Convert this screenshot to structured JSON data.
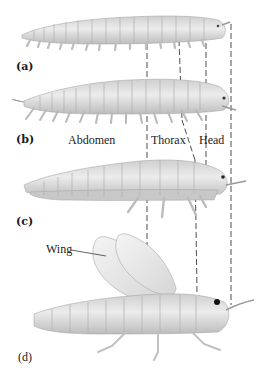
{
  "figure": {
    "panels": [
      {
        "id": "a",
        "label": "(a)",
        "description": "Segmented worm-like ancestor with paired legs on every segment"
      },
      {
        "id": "b",
        "label": "(b)",
        "description": "Segmented animal with slightly differentiated head"
      },
      {
        "id": "c",
        "label": "(c)",
        "description": "Segments grouped; legs reduced on abdomen"
      },
      {
        "id": "d",
        "label": "(d)",
        "description": "Winged insect with distinct head, thorax and abdomen"
      }
    ],
    "region_labels": {
      "abdomen": "Abdomen",
      "thorax": "Thorax",
      "head": "Head"
    },
    "callouts": {
      "wing": "Wing"
    },
    "colors": {
      "body_fill": "#dedede",
      "body_shade": "#b9b9b9",
      "segment_line": "#9a9a9a",
      "dashed_line": "#333333",
      "text": "#1a1a1a"
    }
  }
}
